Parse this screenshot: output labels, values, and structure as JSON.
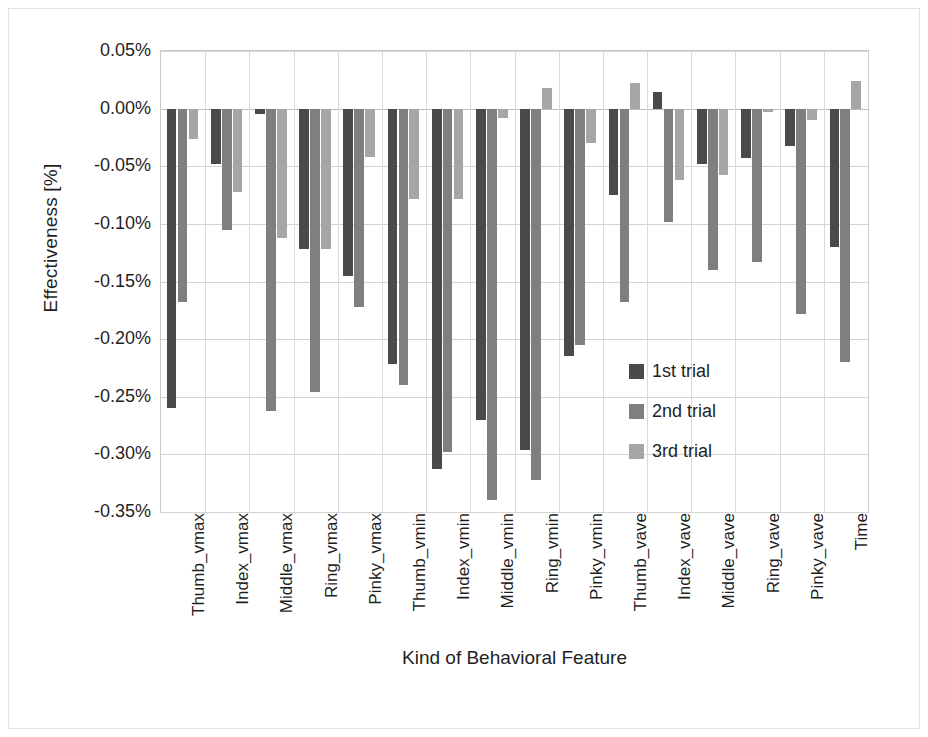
{
  "chart_data": {
    "type": "bar",
    "title": "",
    "xlabel": "Kind of Behavioral Feature",
    "ylabel": "Effectiveness [%]",
    "ylim": [
      -0.35,
      0.05
    ],
    "ytick_labels": [
      "0.05%",
      "0.00%",
      "-0.05%",
      "-0.10%",
      "-0.15%",
      "-0.20%",
      "-0.25%",
      "-0.30%",
      "-0.35%"
    ],
    "ytick_values": [
      0.05,
      0.0,
      -0.05,
      -0.1,
      -0.15,
      -0.2,
      -0.25,
      -0.3,
      -0.35
    ],
    "grid": true,
    "legend_position": "inside-right",
    "categories": [
      "Thumb_vmax",
      "Index_vmax",
      "Middle_vmax",
      "Ring_vmax",
      "Pinky_vmax",
      "Thumb_vmin",
      "Index_vmin",
      "Middle_vmin",
      "Ring_vmin",
      "Pinky_vmin",
      "Thumb_vave",
      "Index_vave",
      "Middle_vave",
      "Ring_vave",
      "Pinky_vave",
      "Time"
    ],
    "series": [
      {
        "name": "1st trial",
        "color": "#4a4a4a",
        "values": [
          -0.26,
          -0.048,
          -0.005,
          -0.122,
          -0.145,
          -0.222,
          -0.313,
          -0.27,
          -0.296,
          -0.215,
          -0.075,
          0.014,
          -0.048,
          -0.043,
          -0.032,
          -0.12
        ]
      },
      {
        "name": "2nd trial",
        "color": "#7f7f7f",
        "values": [
          -0.168,
          -0.105,
          -0.262,
          -0.246,
          -0.172,
          -0.24,
          -0.298,
          -0.34,
          -0.322,
          -0.205,
          -0.168,
          -0.098,
          -0.14,
          -0.133,
          -0.178,
          -0.22
        ]
      },
      {
        "name": "3rd trial",
        "color": "#a6a6a6",
        "values": [
          -0.026,
          -0.072,
          -0.112,
          -0.122,
          -0.042,
          -0.078,
          -0.078,
          -0.008,
          0.018,
          -0.03,
          0.022,
          -0.062,
          -0.058,
          -0.003,
          -0.01,
          0.024
        ]
      }
    ]
  },
  "legend": {
    "items": [
      {
        "label": "1st trial",
        "color": "#4a4a4a"
      },
      {
        "label": "2nd trial",
        "color": "#7f7f7f"
      },
      {
        "label": "3rd trial",
        "color": "#a6a6a6"
      }
    ]
  }
}
